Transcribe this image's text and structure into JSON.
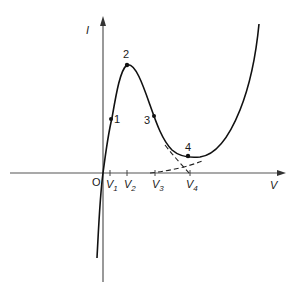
{
  "diagram": {
    "title": "",
    "axes": {
      "x_label": "V",
      "y_label": "I",
      "origin_label": "O"
    },
    "points": [
      {
        "id": "1",
        "label": "1"
      },
      {
        "id": "2",
        "label": "2"
      },
      {
        "id": "3",
        "label": "3"
      },
      {
        "id": "4",
        "label": "4"
      }
    ],
    "x_ticks": [
      {
        "base": "V",
        "sub": "1"
      },
      {
        "base": "V",
        "sub": "2"
      },
      {
        "base": "V",
        "sub": "3"
      },
      {
        "base": "V",
        "sub": "4"
      }
    ],
    "colors": {
      "curve": "#111111",
      "axis": "#555555",
      "background": "#ffffff"
    }
  }
}
